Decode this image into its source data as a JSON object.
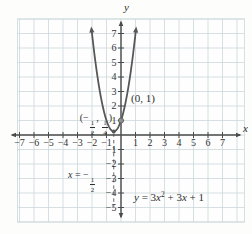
{
  "figure": {
    "colors": {
      "page_bg": "#fdfdfb",
      "plot_bg": "#fefefe",
      "grid": "#ccd7db",
      "axis": "#4b4b4b",
      "curve": "#575757",
      "dashed": "#6a6a6a",
      "point": "#909090",
      "text": "#2e2e2e"
    }
  },
  "chart_data": {
    "type": "line",
    "subtype": "function-plot",
    "title": "",
    "equation": "y = 3x^2 + 3x + 1",
    "coefficients": {
      "a": 3,
      "b": 3,
      "c": 1
    },
    "domain_drawn": [
      -2,
      1
    ],
    "xlabel": "x",
    "ylabel": "y",
    "xlim": [
      -7.8,
      8.6
    ],
    "ylim": [
      -6,
      8
    ],
    "grid": true,
    "x_ticks": [
      -7,
      -6,
      -5,
      -4,
      -3,
      -2,
      -1,
      1,
      2,
      3,
      4,
      5,
      6,
      7
    ],
    "y_ticks": [
      -5,
      -4,
      -3,
      -2,
      -1,
      1,
      2,
      3,
      4,
      5,
      6,
      7
    ],
    "vertex": {
      "x": -0.5,
      "y": 0.25,
      "label": "(-1/2, 1/4)"
    },
    "y_intercept": {
      "x": 0,
      "y": 1,
      "label": "(0, 1)"
    },
    "axis_of_symmetry": {
      "x": -0.5,
      "label": "x = -1/2",
      "style": "dashed"
    }
  },
  "labels": {
    "point": "(0, 1)",
    "y_axis_parts": [
      {
        "t": "y",
        "i": true
      }
    ],
    "x_axis_parts": [
      {
        "t": "x",
        "i": true
      }
    ],
    "vertex_parts": [
      {
        "t": "(−"
      },
      {
        "frac": [
          "1",
          "2"
        ]
      },
      {
        "t": ", "
      },
      {
        "frac": [
          "1",
          "4"
        ]
      },
      {
        "t": ")"
      }
    ],
    "symmetry_parts": [
      {
        "t": "x",
        "i": true
      },
      {
        "t": " = −"
      },
      {
        "frac": [
          "1",
          "2"
        ]
      }
    ],
    "equation_parts": [
      {
        "t": "y",
        "i": true
      },
      {
        "t": " = 3"
      },
      {
        "t": "x",
        "i": true
      },
      {
        "t": "2",
        "sup": true
      },
      {
        "t": " + 3"
      },
      {
        "t": "x",
        "i": true
      },
      {
        "t": " + 1"
      }
    ]
  }
}
